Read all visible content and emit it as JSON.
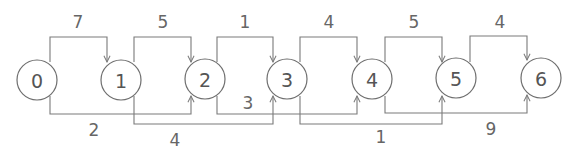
{
  "diagram": {
    "type": "weighted directed graph",
    "nodes": [
      {
        "id": "0",
        "label": "0"
      },
      {
        "id": "1",
        "label": "1"
      },
      {
        "id": "2",
        "label": "2"
      },
      {
        "id": "3",
        "label": "3"
      },
      {
        "id": "4",
        "label": "4"
      },
      {
        "id": "5",
        "label": "5"
      },
      {
        "id": "6",
        "label": "6"
      }
    ],
    "edges": [
      {
        "from": "0",
        "to": "1",
        "weight": "7",
        "route": "top"
      },
      {
        "from": "1",
        "to": "2",
        "weight": "5",
        "route": "top"
      },
      {
        "from": "2",
        "to": "3",
        "weight": "1",
        "route": "top"
      },
      {
        "from": "3",
        "to": "4",
        "weight": "4",
        "route": "top"
      },
      {
        "from": "4",
        "to": "5",
        "weight": "5",
        "route": "top"
      },
      {
        "from": "5",
        "to": "6",
        "weight": "4",
        "route": "top"
      },
      {
        "from": "0",
        "to": "2",
        "weight": "2",
        "route": "bottom"
      },
      {
        "from": "1",
        "to": "3",
        "weight": "4",
        "route": "bottom"
      },
      {
        "from": "2",
        "to": "4",
        "weight": "3",
        "route": "bottom"
      },
      {
        "from": "3",
        "to": "5",
        "weight": "1",
        "route": "bottom"
      },
      {
        "from": "4",
        "to": "6",
        "weight": "9",
        "route": "bottom"
      }
    ]
  }
}
